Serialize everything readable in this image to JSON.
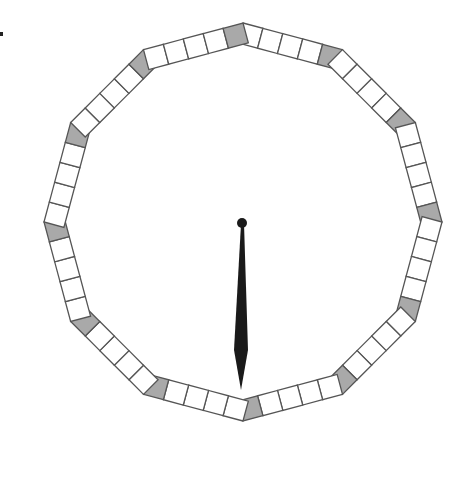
{
  "diagram": {
    "type": "clock-dial",
    "segments": 12,
    "squares_per_segment": 5,
    "highlighted_square_position": "last (clockwise end, adjacent to hour vertex)",
    "hand": {
      "type": "single-hand",
      "points_to": "6"
    },
    "colors": {
      "square_fill": "#ffffff",
      "highlight_fill": "#a9a9a9",
      "stroke": "#555555",
      "hand": "#1a1a1a"
    },
    "geometry": {
      "cx": 243,
      "cy": 222,
      "radius": 199,
      "square_size": 19
    }
  }
}
